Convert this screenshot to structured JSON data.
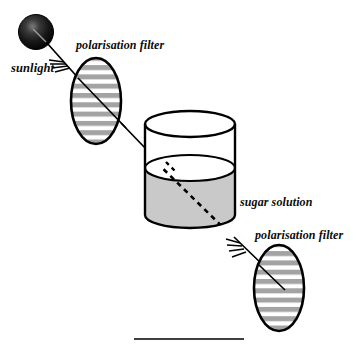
{
  "diagram": {
    "labels": {
      "sunlight": "sunlight",
      "filter_top": "polarisation filter",
      "sugar_solution": "sugar solution",
      "filter_bottom": "polarisation filter"
    },
    "colors": {
      "ink": "#000000",
      "sun_fill_dark": "#111111",
      "sun_fill_mid": "#2b2b2b",
      "sun_highlight": "#6f6f6f",
      "solution_fill": "#c9c9c9",
      "filter_stripe": "#a3a3a3",
      "filter_gap": "#ffffff",
      "background": "#ffffff"
    },
    "elements": {
      "sun": {
        "name": "sunlight-source",
        "shape": "filled-circle",
        "cx": 36,
        "cy": 32,
        "r": 17
      },
      "filter_top": {
        "name": "polarisation-filter-top",
        "shape": "ellipse",
        "cx": 96,
        "cy": 101,
        "rx": 25,
        "ry": 43,
        "stripe_count": 9,
        "orientation": "horizontal"
      },
      "filter_bottom": {
        "name": "polarisation-filter-bottom",
        "shape": "ellipse",
        "cx": 279,
        "cy": 288,
        "rx": 25,
        "ry": 43,
        "stripe_count": 9,
        "orientation": "horizontal"
      },
      "beaker": {
        "name": "sugar-solution-beaker",
        "shape": "cylinder",
        "cx": 190,
        "top_y": 124,
        "bottom_y": 215,
        "rx": 45,
        "ry": 13,
        "liquid_surface_y": 168
      },
      "rays": [
        {
          "name": "ray-sun-to-filter-top",
          "style": "solid",
          "arrow": "feathered",
          "from": [
            48,
            44
          ],
          "to": [
            122,
            135
          ]
        },
        {
          "name": "ray-filter-top-to-beaker",
          "style": "solid",
          "from": [
            118,
            130
          ],
          "to": [
            172,
            177
          ]
        },
        {
          "name": "ray-through-solution",
          "style": "dashed",
          "from": [
            166,
            172
          ],
          "to": [
            232,
            236
          ]
        },
        {
          "name": "ray-beaker-to-filter-bottom",
          "style": "solid",
          "arrow": "feathered",
          "from": [
            228,
            232
          ],
          "to": [
            268,
            271
          ]
        },
        {
          "name": "ray-inside-filter-top",
          "style": "solid",
          "from": [
            72,
            74
          ],
          "to": [
            128,
            128
          ]
        },
        {
          "name": "ray-inside-filter-bottom",
          "style": "solid",
          "from": [
            258,
            264
          ],
          "to": [
            288,
            290
          ]
        }
      ],
      "baseline": {
        "name": "baseline-rule",
        "x1": 134,
        "x2": 244,
        "y": 339
      }
    }
  }
}
